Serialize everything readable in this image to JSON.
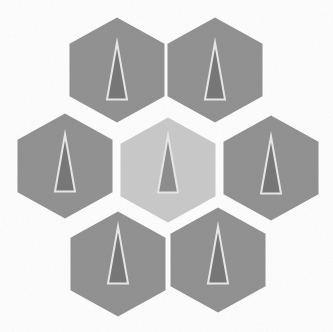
{
  "figure": {
    "canvas": {
      "width": 333,
      "height": 332,
      "background": "#ffffff"
    },
    "hex_geometry": {
      "width": 95,
      "height": 105
    },
    "triangle_geometry": {
      "width": 20,
      "height": 57,
      "outline_color": "#e9e9e9",
      "outline_width": 2
    },
    "colors": {
      "outer_hex_fill": "#909090",
      "center_hex_fill": "#c9c9c9",
      "outer_triangle_fill": "#757575",
      "center_triangle_fill": "#8c8c8c"
    },
    "grain_opacity": 0.1,
    "hexagons": [
      {
        "id": "top-left",
        "cx": 117,
        "cy": 70,
        "fill": "#909090",
        "triangle_fill": "#757575",
        "triangle_dy": 1
      },
      {
        "id": "top-right",
        "cx": 215,
        "cy": 70,
        "fill": "#909090",
        "triangle_fill": "#757575",
        "triangle_dy": 1
      },
      {
        "id": "middle-left",
        "cx": 65,
        "cy": 166,
        "fill": "#909090",
        "triangle_fill": "#757575",
        "triangle_dy": -3
      },
      {
        "id": "center",
        "cx": 168,
        "cy": 170,
        "fill": "#c9c9c9",
        "triangle_fill": "#8c8c8c",
        "triangle_dy": -6
      },
      {
        "id": "middle-right",
        "cx": 271,
        "cy": 168,
        "fill": "#909090",
        "triangle_fill": "#757575",
        "triangle_dy": -3
      },
      {
        "id": "bottom-left",
        "cx": 118,
        "cy": 264,
        "fill": "#909090",
        "triangle_fill": "#757575",
        "triangle_dy": -9
      },
      {
        "id": "bottom-right",
        "cx": 218,
        "cy": 260,
        "fill": "#909090",
        "triangle_fill": "#757575",
        "triangle_dy": -5
      }
    ]
  }
}
